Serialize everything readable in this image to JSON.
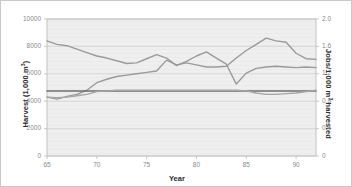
{
  "chart_data": {
    "type": "line",
    "title": "",
    "xlabel": "Year",
    "ylabel": "Harvest (1,000 m³)",
    "ylabel_right": "Jobs/1,000 m³ harvested",
    "xlim": [
      65,
      92
    ],
    "ylim": [
      0,
      10000
    ],
    "ylim_right": [
      0,
      2.0
    ],
    "grid": true,
    "legend": "none",
    "xticks": [
      65,
      70,
      75,
      80,
      85,
      90
    ],
    "xtick_labels": [
      "65",
      "70",
      "75",
      "80",
      "85",
      "90"
    ],
    "yticks_left": [
      0,
      2000,
      4000,
      6000,
      8000,
      10000
    ],
    "ytick_labels_left": [
      "0",
      "2000",
      "4000",
      "6000",
      "8000",
      "10000"
    ],
    "yticks_right": [
      0,
      0.4,
      0.8,
      1.2,
      1.6,
      2.0
    ],
    "ytick_labels_right": [
      "0",
      "0.4",
      "0.8",
      "1.2",
      "1.6",
      "2.0"
    ],
    "x": [
      65,
      66,
      67,
      68,
      69,
      70,
      71,
      72,
      73,
      74,
      75,
      76,
      77,
      78,
      79,
      80,
      81,
      82,
      83,
      84,
      85,
      86,
      87,
      88,
      89,
      90,
      91,
      92
    ],
    "series": [
      {
        "name": "Harvest",
        "axis": "left",
        "color": "#9a9a9a",
        "values": [
          8400,
          8150,
          8050,
          7800,
          7550,
          7300,
          7150,
          6950,
          6750,
          6800,
          7100,
          7400,
          7150,
          6600,
          6900,
          7300,
          7600,
          7150,
          6700,
          5250,
          6050,
          6400,
          6500,
          6550,
          6500,
          6450,
          6500,
          6450
        ]
      },
      {
        "name": "Jobs per 1,000 m3 harvested",
        "axis": "right",
        "color": "#9a9a9a",
        "values": [
          0.86,
          0.83,
          0.87,
          0.9,
          0.96,
          1.07,
          1.12,
          1.16,
          1.18,
          1.2,
          1.22,
          1.24,
          1.4,
          1.33,
          1.36,
          1.33,
          1.3,
          1.3,
          1.31,
          1.43,
          1.54,
          1.63,
          1.72,
          1.68,
          1.66,
          1.5,
          1.42,
          1.41
        ]
      },
      {
        "name": "Reference level",
        "axis": "left",
        "color": "#6f6f6f",
        "values": [
          4750,
          4750,
          4750,
          4750,
          4750,
          4750,
          4750,
          4750,
          4750,
          4750,
          4750,
          4750,
          4750,
          4750,
          4750,
          4750,
          4750,
          4750,
          4750,
          4750,
          4750,
          4750,
          4750,
          4750,
          4750,
          4750,
          4750,
          4750
        ]
      },
      {
        "name": "Lower trace",
        "axis": "left",
        "color": "#a6a6a6",
        "values": [
          4300,
          4250,
          4300,
          4400,
          4500,
          4700,
          4750,
          4800,
          4800,
          4800,
          4800,
          4800,
          4800,
          4800,
          4800,
          4800,
          4800,
          4800,
          4800,
          4800,
          4750,
          4600,
          4500,
          4500,
          4550,
          4600,
          4700,
          4800
        ]
      }
    ],
    "plot_area": {
      "left": 46,
      "top": 18,
      "right": 315,
      "bottom": 155
    },
    "colors": {
      "plot_bg": "#efefef",
      "grid": "#d2d2d2",
      "frame": "#bdbdbd",
      "tick_text": "#8a8a8a",
      "title_text": "#2b2b2b"
    }
  }
}
